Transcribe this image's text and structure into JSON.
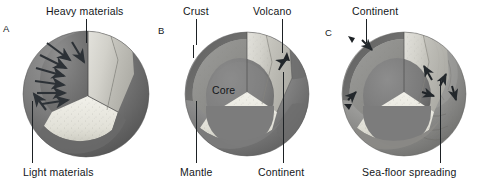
{
  "figure": {
    "kind": "scientific-diagram",
    "background_color": "#ffffff",
    "label_color": "#14171a"
  },
  "panels": [
    {
      "id": "A",
      "letter": "A",
      "name": "differentiation",
      "labels": [
        {
          "id": "heavy-materials",
          "text": "Heavy materials",
          "x": 46,
          "y": 5
        },
        {
          "id": "light-materials",
          "text": "Light materials",
          "x": 23,
          "y": 166
        }
      ],
      "arrows_meaning": "heavy materials sink inward, light materials rise outward"
    },
    {
      "id": "B",
      "letter": "B",
      "name": "layered-earth",
      "labels": [
        {
          "id": "crust",
          "text": "Crust",
          "x": 183,
          "y": 5
        },
        {
          "id": "volcano",
          "text": "Volcano",
          "x": 253,
          "y": 5
        },
        {
          "id": "core",
          "text": "Core",
          "x": 212,
          "y": 84
        },
        {
          "id": "mantle",
          "text": "Mantle",
          "x": 180,
          "y": 166
        },
        {
          "id": "continent",
          "text": "Continent",
          "x": 258,
          "y": 166
        }
      ]
    },
    {
      "id": "C",
      "letter": "C",
      "name": "plate-tectonics",
      "labels": [
        {
          "id": "continent",
          "text": "Continent",
          "x": 352,
          "y": 5
        },
        {
          "id": "sea-floor-spreading",
          "text": "Sea-floor spreading",
          "x": 362,
          "y": 166
        }
      ],
      "arrows_meaning": "plate motion and sea-floor spreading directions"
    }
  ],
  "palette": {
    "outer_dark": "#6e6e6e",
    "outer_mid": "#8a8a8a",
    "outer_light": "#a6a6a6",
    "cut_face_light": "#cfcfcb",
    "cut_face_pale": "#e4e3dd",
    "core_dark": "#7a7a7a",
    "mantle_mid": "#949494",
    "speckle": "#efeee8",
    "line": "#1d2124"
  }
}
